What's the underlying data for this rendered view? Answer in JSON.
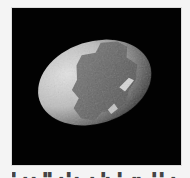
{
  "figure": {
    "background_color": "#020202",
    "page_color": "#f4f4f4",
    "shell_light_color": "#c8c8c8",
    "patch_color": "#6e6e6e"
  },
  "caption": {
    "text": "▘▗ ▖▝▘▗ ▘▖ ▗ ▝▖ ▘ ▗▖ ▝ ▘▗"
  }
}
